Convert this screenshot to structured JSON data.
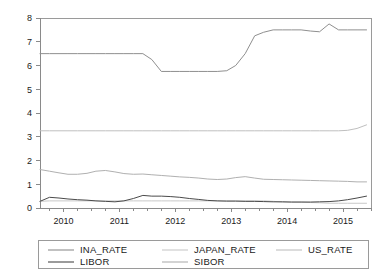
{
  "chart_data": {
    "type": "line",
    "title": "",
    "subtitle": "",
    "xlabel": "",
    "ylabel": "",
    "xlim": [
      2009.58,
      2015.5
    ],
    "ylim": [
      0,
      8
    ],
    "yticks": [
      0,
      1,
      2,
      3,
      4,
      5,
      6,
      7,
      8
    ],
    "ytick_labels": [
      "0",
      "1",
      "2",
      "3",
      "4",
      "5",
      "6",
      "7",
      "8"
    ],
    "xticks": [
      2010,
      2011,
      2012,
      2013,
      2014,
      2015
    ],
    "xtick_labels": [
      "2010",
      "2011",
      "2012",
      "2013",
      "2014",
      "2015"
    ],
    "grid": false,
    "legend_position": "bottom",
    "x": [
      2009.58,
      2009.75,
      2009.92,
      2010.08,
      2010.25,
      2010.42,
      2010.58,
      2010.75,
      2010.92,
      2011.08,
      2011.25,
      2011.42,
      2011.58,
      2011.75,
      2011.92,
      2012.08,
      2012.25,
      2012.42,
      2012.58,
      2012.75,
      2012.92,
      2013.08,
      2013.25,
      2013.42,
      2013.58,
      2013.75,
      2013.92,
      2014.08,
      2014.25,
      2014.42,
      2014.58,
      2014.75,
      2014.92,
      2015.08,
      2015.25,
      2015.42
    ],
    "series": [
      {
        "name": "INA_RATE",
        "color": "#8f8f8f",
        "width": 1.0,
        "values": [
          6.5,
          6.5,
          6.5,
          6.5,
          6.5,
          6.5,
          6.5,
          6.5,
          6.5,
          6.5,
          6.5,
          6.5,
          6.25,
          5.75,
          5.75,
          5.75,
          5.75,
          5.75,
          5.75,
          5.75,
          5.78,
          6.0,
          6.5,
          7.25,
          7.4,
          7.5,
          7.5,
          7.5,
          7.5,
          7.45,
          7.42,
          7.75,
          7.5,
          7.5,
          7.5,
          7.5
        ]
      },
      {
        "name": "JAPAN_RATE",
        "color": "#c8c8c8",
        "width": 1.0,
        "values": [
          0.28,
          0.3,
          0.3,
          0.3,
          0.3,
          0.3,
          0.3,
          0.3,
          0.3,
          0.3,
          0.3,
          0.3,
          0.3,
          0.3,
          0.3,
          0.3,
          0.3,
          0.3,
          0.3,
          0.3,
          0.3,
          0.3,
          0.3,
          0.3,
          0.3,
          0.28,
          0.25,
          0.25,
          0.25,
          0.23,
          0.22,
          0.2,
          0.2,
          0.2,
          0.2,
          0.2
        ]
      },
      {
        "name": "US_RATE",
        "color": "#bfbfbf",
        "width": 1.0,
        "values": [
          3.25,
          3.25,
          3.25,
          3.25,
          3.25,
          3.25,
          3.25,
          3.25,
          3.25,
          3.25,
          3.25,
          3.25,
          3.25,
          3.25,
          3.25,
          3.25,
          3.25,
          3.25,
          3.25,
          3.25,
          3.25,
          3.25,
          3.25,
          3.25,
          3.25,
          3.25,
          3.25,
          3.25,
          3.25,
          3.25,
          3.25,
          3.25,
          3.25,
          3.27,
          3.35,
          3.5
        ]
      },
      {
        "name": "LIBOR",
        "color": "#4a4a4a",
        "width": 1.0,
        "values": [
          0.28,
          0.45,
          0.42,
          0.38,
          0.35,
          0.33,
          0.3,
          0.28,
          0.26,
          0.3,
          0.4,
          0.53,
          0.5,
          0.5,
          0.48,
          0.45,
          0.4,
          0.36,
          0.32,
          0.3,
          0.29,
          0.29,
          0.28,
          0.28,
          0.27,
          0.26,
          0.26,
          0.25,
          0.25,
          0.25,
          0.26,
          0.27,
          0.3,
          0.35,
          0.42,
          0.5
        ]
      },
      {
        "name": "SIBOR",
        "color": "#b0b0b0",
        "width": 1.0,
        "values": [
          1.62,
          1.55,
          1.48,
          1.42,
          1.42,
          1.46,
          1.55,
          1.58,
          1.52,
          1.45,
          1.42,
          1.43,
          1.4,
          1.37,
          1.34,
          1.31,
          1.29,
          1.26,
          1.22,
          1.2,
          1.22,
          1.28,
          1.32,
          1.26,
          1.21,
          1.2,
          1.19,
          1.18,
          1.17,
          1.16,
          1.15,
          1.14,
          1.13,
          1.12,
          1.1,
          1.1
        ]
      }
    ],
    "legend_entries": [
      {
        "label": "INA_RATE",
        "color": "#8f8f8f"
      },
      {
        "label": "JAPAN_RATE",
        "color": "#c8c8c8"
      },
      {
        "label": "US_RATE",
        "color": "#bfbfbf"
      },
      {
        "label": "LIBOR",
        "color": "#4a4a4a"
      },
      {
        "label": "SIBOR",
        "color": "#b0b0b0"
      }
    ]
  }
}
